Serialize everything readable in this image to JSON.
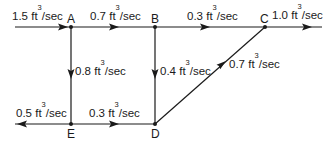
{
  "diagram": {
    "type": "flow-network",
    "unit_base": "ft",
    "unit_exp": "3",
    "unit_tail": "/sec",
    "nodes": [
      {
        "id": "A",
        "label": "A"
      },
      {
        "id": "B",
        "label": "B"
      },
      {
        "id": "C",
        "label": "C"
      },
      {
        "id": "D",
        "label": "D"
      },
      {
        "id": "E",
        "label": "E"
      }
    ],
    "edges": [
      {
        "id": "in-A",
        "from": "source",
        "to": "A",
        "value": "1.5"
      },
      {
        "id": "A-B",
        "from": "A",
        "to": "B",
        "value": "0.7"
      },
      {
        "id": "B-C",
        "from": "B",
        "to": "C",
        "value": "0.3"
      },
      {
        "id": "C-out",
        "from": "C",
        "to": "sink",
        "value": "1.0"
      },
      {
        "id": "A-E",
        "from": "A",
        "to": "E",
        "value": "0.8"
      },
      {
        "id": "B-D",
        "from": "B",
        "to": "D",
        "value": "0.4"
      },
      {
        "id": "D-C",
        "from": "D",
        "to": "C",
        "value": "0.7"
      },
      {
        "id": "E-D",
        "from": "E",
        "to": "D",
        "value": "0.3"
      },
      {
        "id": "E-out",
        "from": "E",
        "to": "sink",
        "value": "0.5"
      }
    ],
    "line_color": "#1a1a1a"
  }
}
